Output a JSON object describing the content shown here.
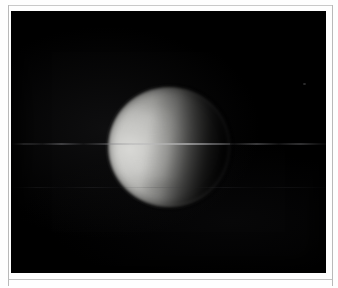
{
  "frame": {
    "mat_color": "#fefefe",
    "rule_color": "#b9b9b9",
    "plate_background": "#000000",
    "caption": ""
  },
  "image": {
    "kind": "astronomical-photograph",
    "subject": "planetary-body-disk",
    "phase": "gibbous",
    "illumination_direction": "left",
    "terminator_side": "right",
    "background": "black-sky",
    "body": {
      "center_x_px": 158,
      "center_y_px": 136,
      "diameter_px": 122,
      "brightest_color": "#d9d9d6",
      "midtone_color": "#9b9b98",
      "shadow_color": "#050506",
      "limb_softness": "soft"
    },
    "artifacts": [
      {
        "name": "horizontal-scanline-primary",
        "type": "streak",
        "y_px": 143,
        "brightness": "faint",
        "color": "#8a8a8e"
      },
      {
        "name": "horizontal-scanline-secondary",
        "type": "streak",
        "y_px": 187,
        "brightness": "very-faint",
        "color": "#46464a"
      },
      {
        "name": "background-speck",
        "type": "point",
        "x_px": 305,
        "y_px": 84,
        "brightness": "very-faint",
        "color": "#60606 4"
      }
    ]
  },
  "viewer": {
    "width_px": 338,
    "height_px": 288
  }
}
